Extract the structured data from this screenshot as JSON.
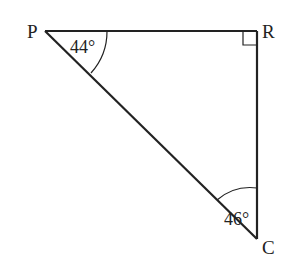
{
  "diagram": {
    "type": "right-triangle",
    "vertices": [
      {
        "name": "P",
        "label": "P"
      },
      {
        "name": "R",
        "label": "R"
      },
      {
        "name": "C",
        "label": "C"
      }
    ],
    "angles": {
      "P": "44°",
      "C": "46°",
      "R": "right-angle"
    },
    "colors": {
      "stroke": "#222222",
      "background": "#ffffff"
    }
  }
}
